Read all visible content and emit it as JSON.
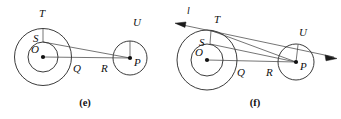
{
  "figure": {
    "background_color": "#ffffff",
    "stroke_color": "#262626",
    "label_color": "#101010",
    "width": 341,
    "height": 119
  },
  "panels": [
    {
      "id": "e",
      "caption": "(e)",
      "caption_x": 85,
      "caption_y": 106,
      "big_circle": {
        "label": "O",
        "cx": 43,
        "cy": 57,
        "r_outer": 28.5,
        "r_inner": 15
      },
      "small_circle": {
        "label": "P",
        "cx": 130,
        "cy": 58,
        "r": 17
      },
      "points": [
        {
          "name": "T",
          "label": "T",
          "x": 43,
          "y": 28.5,
          "label_x": 39,
          "label_y": 17
        },
        {
          "name": "S",
          "label": "S",
          "x": 43,
          "y": 42,
          "label_x": 33,
          "label_y": 42
        },
        {
          "name": "O",
          "label": "O",
          "x": 43,
          "y": 57,
          "label_x": 31,
          "label_y": 53
        },
        {
          "name": "Q",
          "label": "Q",
          "x": 71.5,
          "y": 57,
          "label_x": 73,
          "label_y": 72
        },
        {
          "name": "R",
          "label": "R",
          "x": 113,
          "y": 58,
          "label_x": 101,
          "label_y": 72
        },
        {
          "name": "P",
          "label": "P",
          "x": 130,
          "y": 58,
          "label_x": 134,
          "label_y": 66
        },
        {
          "name": "U",
          "label": "U",
          "x": 130,
          "y": 41,
          "label_x": 133,
          "label_y": 26
        }
      ],
      "segments": [
        {
          "name": "segment-T-S",
          "from": "T",
          "to": "S"
        },
        {
          "name": "segment-S-P",
          "from": "S",
          "to": "P"
        },
        {
          "name": "segment-O-P",
          "from": "O",
          "to": "P"
        },
        {
          "name": "segment-O-Q",
          "from": "O",
          "to": "Q"
        },
        {
          "name": "segment-U-P",
          "from": "U",
          "to": "P"
        }
      ],
      "has_tangent_line": false,
      "tangent_line_label": ""
    },
    {
      "id": "f",
      "caption": "(f)",
      "caption_x": 85,
      "caption_y": 106,
      "big_circle": {
        "label": "O",
        "cx": 37,
        "cy": 60,
        "r_outer": 30,
        "r_inner": 16
      },
      "small_circle": {
        "label": "P",
        "cx": 126,
        "cy": 62,
        "r": 18
      },
      "points": [
        {
          "name": "T",
          "label": "T",
          "x": 41,
          "y": 30.5,
          "label_x": 44,
          "label_y": 23
        },
        {
          "name": "S",
          "label": "S",
          "x": 40,
          "y": 44,
          "label_x": 29,
          "label_y": 46
        },
        {
          "name": "O",
          "label": "O",
          "x": 37,
          "y": 60,
          "label_x": 25,
          "label_y": 56
        },
        {
          "name": "Q",
          "label": "Q",
          "x": 67,
          "y": 60,
          "label_x": 67,
          "label_y": 76
        },
        {
          "name": "R",
          "label": "R",
          "x": 108,
          "y": 62,
          "label_x": 96,
          "label_y": 76
        },
        {
          "name": "P",
          "label": "P",
          "x": 126,
          "y": 62,
          "label_x": 130,
          "label_y": 70
        },
        {
          "name": "U",
          "label": "U",
          "x": 128,
          "y": 45,
          "label_x": 129,
          "label_y": 36
        }
      ],
      "segments": [
        {
          "name": "segment-T-S",
          "from": "T",
          "to": "S"
        },
        {
          "name": "segment-S-P",
          "from": "S",
          "to": "P"
        },
        {
          "name": "segment-O-P",
          "from": "O",
          "to": "P"
        },
        {
          "name": "segment-O-Q",
          "from": "O",
          "to": "Q"
        },
        {
          "name": "segment-U-P",
          "from": "U",
          "to": "P"
        },
        {
          "name": "segment-T-U",
          "from": "T",
          "to": "U"
        }
      ],
      "has_tangent_line": true,
      "tangent_line_label": "l",
      "tangent_label_x": 17,
      "tangent_label_y": 14,
      "tangent_start_x": 5,
      "tangent_start_y": 25,
      "tangent_end_x": 166,
      "tangent_end_y": 58
    }
  ]
}
